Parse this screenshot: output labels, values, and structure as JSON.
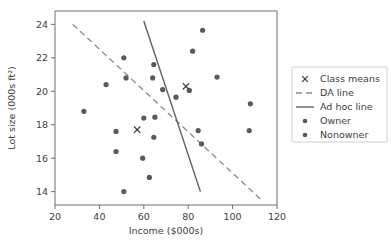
{
  "figure": {
    "background": "#ffffff",
    "point_color": "#5a5a5a",
    "da_line_color": "#8a8a8a",
    "adhoc_line_color": "#5f5f5f",
    "mean_marker_color": "#3a3a3a"
  },
  "legend": {
    "entries": [
      {
        "label": "Class means",
        "marker": "x-marker",
        "name": "legend-item-class-means"
      },
      {
        "label": "DA line",
        "marker": "dashed-line",
        "name": "legend-item-da-line"
      },
      {
        "label": "Ad hoc line",
        "marker": "solid-line",
        "name": "legend-item-ad-hoc-line"
      },
      {
        "label": "Owner",
        "marker": "dot-marker",
        "name": "legend-item-owner"
      },
      {
        "label": "Nonowner",
        "marker": "dot-marker",
        "name": "legend-item-nonowner"
      }
    ]
  },
  "chart_data": {
    "type": "scatter",
    "title": "",
    "xlabel": "Income ($000s)",
    "ylabel": "Lot size (000s ft²)",
    "xlim": [
      20,
      120
    ],
    "ylim": [
      13.2,
      24.8
    ],
    "xticks": [
      20,
      40,
      60,
      80,
      100,
      120
    ],
    "yticks": [
      14,
      16,
      18,
      20,
      22,
      24
    ],
    "xtick_labels": [
      "20",
      "40",
      "60",
      "80",
      "100",
      "120"
    ],
    "ytick_labels": [
      "14",
      "16",
      "18",
      "20",
      "22",
      "24"
    ],
    "grid": false,
    "legend_position": "right-outside",
    "series": [
      {
        "name": "Owner",
        "marker": "dot",
        "points": [
          [
            51.0,
            22.0
          ],
          [
            52.0,
            20.8
          ],
          [
            64.5,
            21.6
          ],
          [
            64.0,
            20.8
          ],
          [
            68.5,
            20.1
          ],
          [
            74.5,
            19.65
          ],
          [
            80.5,
            20.05
          ],
          [
            82.0,
            22.4
          ],
          [
            86.5,
            23.65
          ],
          [
            93.0,
            20.85
          ],
          [
            108.0,
            19.25
          ],
          [
            84.5,
            17.65
          ],
          [
            86.0,
            16.85
          ],
          [
            65.0,
            18.45
          ],
          [
            60.0,
            18.4
          ]
        ]
      },
      {
        "name": "Nonowner",
        "marker": "dot",
        "points": [
          [
            33.0,
            18.8
          ],
          [
            43.0,
            20.4
          ],
          [
            47.5,
            17.6
          ],
          [
            47.5,
            16.4
          ],
          [
            51.0,
            14.0
          ],
          [
            59.5,
            16.0
          ],
          [
            62.5,
            14.85
          ],
          [
            64.5,
            17.25
          ],
          [
            107.5,
            17.65
          ]
        ]
      },
      {
        "name": "Class means",
        "marker": "x",
        "points": [
          [
            57.0,
            17.7
          ],
          [
            79.0,
            20.3
          ]
        ]
      }
    ],
    "lines": [
      {
        "name": "DA line",
        "style": "dashed",
        "x": [
          28.0,
          113.0
        ],
        "y": [
          24.0,
          13.5
        ]
      },
      {
        "name": "Ad hoc line",
        "style": "solid",
        "x": [
          60.0,
          85.5
        ],
        "y": [
          24.2,
          14.0
        ]
      }
    ]
  }
}
